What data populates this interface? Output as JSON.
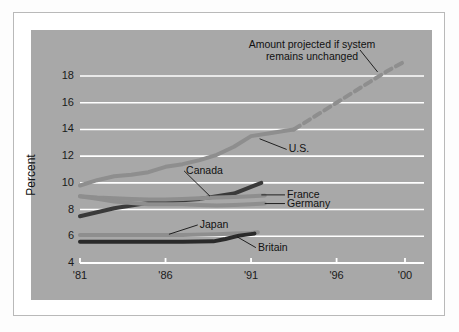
{
  "figure": {
    "background": "#fdfdfd",
    "plot_background": "#a8a8a8",
    "border_color": "#b9b9b9"
  },
  "annotations": {
    "projection_note_line1": "Amount projected if system",
    "projection_note_line2": "remains unchanged"
  },
  "chart_data": {
    "type": "line",
    "title": "",
    "subtitle": "",
    "xlabel": "",
    "ylabel": "Percent",
    "xlim": [
      1981,
      2000
    ],
    "ylim": [
      4,
      19.5
    ],
    "yticks": [
      4,
      6,
      8,
      10,
      12,
      14,
      16,
      18
    ],
    "ytick_labels": [
      "4",
      "6",
      "8",
      "10",
      "12",
      "14",
      "16",
      "18"
    ],
    "xticks": [
      1981,
      1986,
      1991,
      1996,
      2000
    ],
    "xtick_labels": [
      "'81",
      "'86",
      "'91",
      "'96",
      "'00"
    ],
    "grid": "horizontal",
    "grid_color": "#ffffff",
    "legend": "inline-labels",
    "annotations": [
      {
        "text": "Amount projected if system remains unchanged",
        "target_series": "U.S. (projected)",
        "x": 1998.2,
        "y": 18.3
      }
    ],
    "series": [
      {
        "name": "U.S.",
        "label": "U.S.",
        "color": "#8e8e8e",
        "style": "solid",
        "width": 4,
        "label_x": 1993.2,
        "label_y": 12.5,
        "x": [
          1981,
          1982,
          1983,
          1984,
          1985,
          1986,
          1987,
          1988,
          1989,
          1990,
          1991,
          1992,
          1993,
          1993.5
        ],
        "values": [
          9.8,
          10.2,
          10.5,
          10.6,
          10.8,
          11.2,
          11.4,
          11.7,
          12.1,
          12.7,
          13.5,
          13.7,
          13.9,
          14.0
        ]
      },
      {
        "name": "U.S. (projected)",
        "label": "",
        "color": "#8e8e8e",
        "style": "dashed",
        "width": 4,
        "x": [
          1993.5,
          1994,
          1995,
          1996,
          1997,
          1998,
          1999,
          2000
        ],
        "values": [
          14.0,
          14.4,
          15.2,
          16.0,
          16.8,
          17.6,
          18.4,
          19.1
        ]
      },
      {
        "name": "Canada",
        "label": "Canada",
        "color": "#3a3a3a",
        "style": "solid",
        "width": 4,
        "label_x": 1987.2,
        "label_y": 10.9,
        "x": [
          1981,
          1982,
          1983,
          1984,
          1985,
          1986,
          1987,
          1988,
          1989,
          1990,
          1991,
          1991.6
        ],
        "values": [
          7.5,
          7.8,
          8.1,
          8.3,
          8.5,
          8.6,
          8.7,
          8.8,
          9.0,
          9.2,
          9.7,
          10.0
        ]
      },
      {
        "name": "France",
        "label": "France",
        "color": "#8e8e8e",
        "style": "solid",
        "width": 4,
        "label_x": 1993.1,
        "label_y": 9.1,
        "x": [
          1981,
          1982,
          1983,
          1984,
          1985,
          1986,
          1987,
          1988,
          1989,
          1990,
          1991,
          1991.8
        ],
        "values": [
          9.0,
          8.9,
          8.85,
          8.8,
          8.75,
          8.75,
          8.8,
          8.85,
          8.9,
          8.95,
          9.0,
          9.05
        ]
      },
      {
        "name": "Germany",
        "label": "Germany",
        "color": "#8e8e8e",
        "style": "solid",
        "width": 4,
        "label_x": 1993.1,
        "label_y": 8.45,
        "x": [
          1981,
          1982,
          1983,
          1984,
          1985,
          1986,
          1987,
          1988,
          1989,
          1990,
          1991,
          1991.8
        ],
        "values": [
          9.0,
          8.8,
          8.6,
          8.5,
          8.4,
          8.4,
          8.4,
          8.35,
          8.3,
          8.35,
          8.4,
          8.45
        ]
      },
      {
        "name": "Japan",
        "label": "Japan",
        "color": "#8e8e8e",
        "style": "solid",
        "width": 4,
        "label_x": 1988.0,
        "label_y": 6.85,
        "x": [
          1981,
          1983,
          1985,
          1987,
          1989,
          1990,
          1991,
          1991.4
        ],
        "values": [
          6.1,
          6.1,
          6.1,
          6.1,
          6.15,
          6.2,
          6.25,
          6.3
        ]
      },
      {
        "name": "Britain",
        "label": "Britain",
        "color": "#2a2a2a",
        "style": "solid",
        "width": 4,
        "label_x": 1991.4,
        "label_y": 5.15,
        "x": [
          1981,
          1983,
          1985,
          1987,
          1988.8,
          1989.5,
          1990.3,
          1991.2
        ],
        "values": [
          5.6,
          5.6,
          5.6,
          5.6,
          5.62,
          5.8,
          6.05,
          6.2
        ]
      }
    ]
  }
}
